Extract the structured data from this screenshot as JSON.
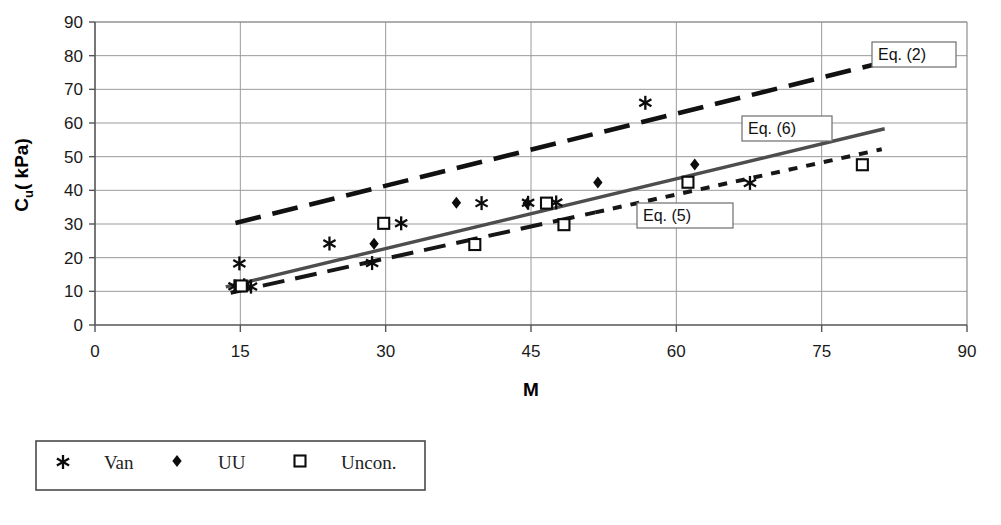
{
  "chart_data": {
    "type": "scatter",
    "title": "",
    "xlabel": "M",
    "ylabel": "C_u ( kPa)",
    "ylabel_main": "C",
    "ylabel_subscript": "u",
    "ylabel_unit": "( kPa)",
    "xlim": [
      0,
      90
    ],
    "ylim": [
      0,
      90
    ],
    "xticks": [
      0,
      15,
      30,
      45,
      60,
      75,
      90
    ],
    "yticks": [
      0,
      10,
      20,
      30,
      40,
      50,
      60,
      70,
      80,
      90
    ],
    "grid": true,
    "legend_position": "below-plot-left",
    "series": [
      {
        "name": "Van",
        "marker": "star",
        "points": [
          {
            "x": 14.4,
            "y": 11.5
          },
          {
            "x": 14.9,
            "y": 18.3
          },
          {
            "x": 15.4,
            "y": 11.8
          },
          {
            "x": 16.1,
            "y": 11.4
          },
          {
            "x": 24.2,
            "y": 24.2
          },
          {
            "x": 28.6,
            "y": 18.4
          },
          {
            "x": 31.6,
            "y": 30.2
          },
          {
            "x": 39.9,
            "y": 36.2
          },
          {
            "x": 44.7,
            "y": 36.3
          },
          {
            "x": 47.6,
            "y": 36.4
          },
          {
            "x": 56.8,
            "y": 66.0
          },
          {
            "x": 67.6,
            "y": 42.2
          }
        ]
      },
      {
        "name": "UU",
        "marker": "diamond",
        "points": [
          {
            "x": 14.7,
            "y": 11.7
          },
          {
            "x": 15.2,
            "y": 11.6
          },
          {
            "x": 28.8,
            "y": 24.1
          },
          {
            "x": 37.3,
            "y": 36.3
          },
          {
            "x": 44.6,
            "y": 36.2
          },
          {
            "x": 51.9,
            "y": 42.3
          },
          {
            "x": 61.9,
            "y": 47.7
          }
        ]
      },
      {
        "name": "Uncon.",
        "marker": "square",
        "points": [
          {
            "x": 15.1,
            "y": 11.6
          },
          {
            "x": 29.8,
            "y": 30.2
          },
          {
            "x": 39.2,
            "y": 23.9
          },
          {
            "x": 46.6,
            "y": 36.2
          },
          {
            "x": 48.4,
            "y": 29.8
          },
          {
            "x": 61.2,
            "y": 42.4
          },
          {
            "x": 79.2,
            "y": 47.6
          }
        ]
      }
    ],
    "trend_lines": [
      {
        "name": "Eq. (2)",
        "style": "long-dash",
        "x1": 14.5,
        "y1": 30.3,
        "x2": 82.0,
        "y2": 78.5
      },
      {
        "name": "Eq. (6)",
        "style": "solid",
        "x1": 13.5,
        "y1": 11.3,
        "x2": 81.5,
        "y2": 58.3
      },
      {
        "name": "Eq. (5)",
        "style": "dash",
        "x1": 14.0,
        "y1": 9.6,
        "x2": 81.2,
        "y2": 52.2
      }
    ],
    "annotations": [
      {
        "label": "Eq. (2)",
        "box_x": 872,
        "box_y": 42,
        "box_w": 84,
        "box_h": 25
      },
      {
        "label": "Eq. (6)",
        "box_x": 742,
        "box_y": 116,
        "box_w": 90,
        "box_h": 25
      },
      {
        "label": "Eq. (5)",
        "box_x": 637,
        "box_y": 203,
        "box_w": 96,
        "box_h": 25
      }
    ]
  },
  "legend": {
    "entries": [
      {
        "label": "Van",
        "marker": "star"
      },
      {
        "label": "UU",
        "marker": "diamond"
      },
      {
        "label": "Uncon.",
        "marker": "square"
      }
    ]
  },
  "colors": {
    "grid": "#9a9a9a",
    "axis": "#555555",
    "marker": "#0c0c0c",
    "trend_solid": "#4d4d4d",
    "trend_dash": "#111111",
    "background": "#ffffff"
  },
  "caption": {
    "text": ""
  }
}
